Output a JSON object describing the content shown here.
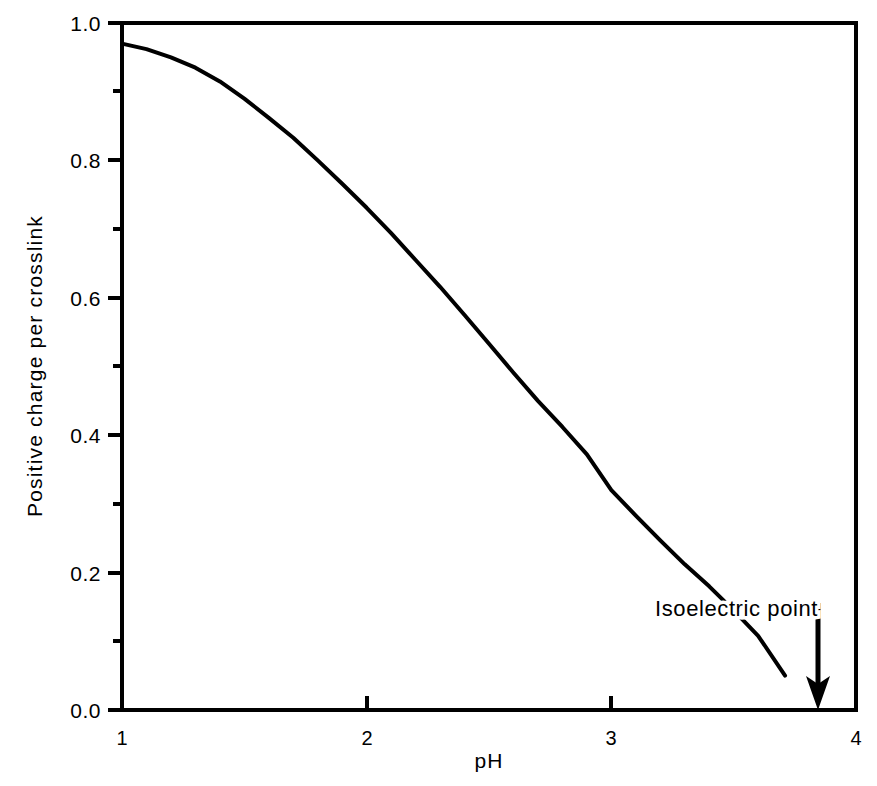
{
  "chart_data": {
    "type": "line",
    "title": "",
    "xlabel": "pH",
    "ylabel": "Positive charge per crosslink",
    "xlim": [
      1,
      4
    ],
    "ylim": [
      0.0,
      1.0
    ],
    "grid": false,
    "legend": null,
    "x_ticks": [
      "1",
      "2",
      "3",
      "4"
    ],
    "x_tick_values": [
      1,
      2,
      3,
      4
    ],
    "x_minor_ticks": [],
    "y_ticks": [
      "0.0",
      "0.2",
      "0.4",
      "0.6",
      "0.8",
      "1.0"
    ],
    "y_tick_values": [
      0.0,
      0.2,
      0.4,
      0.6,
      0.8,
      1.0
    ],
    "y_minor_tick_values": [
      0.1,
      0.3,
      0.5,
      0.7,
      0.9
    ],
    "series": [
      {
        "name": "Positive charge per crosslink",
        "color": "#000000",
        "line_width": 3,
        "x": [
          1.0,
          1.1,
          1.2,
          1.3,
          1.4,
          1.5,
          1.6,
          1.7,
          1.8,
          1.9,
          2.0,
          2.1,
          2.2,
          2.3,
          2.4,
          2.5,
          2.6,
          2.7,
          2.8,
          2.9,
          3.0,
          3.1,
          3.2,
          3.3,
          3.4,
          3.5,
          3.6,
          3.71
        ],
        "y": [
          0.97,
          0.962,
          0.95,
          0.935,
          0.915,
          0.89,
          0.862,
          0.833,
          0.8,
          0.766,
          0.731,
          0.694,
          0.655,
          0.616,
          0.575,
          0.533,
          0.491,
          0.45,
          0.412,
          0.372,
          0.32,
          0.283,
          0.247,
          0.212,
          0.18,
          0.145,
          0.108,
          0.05
        ]
      }
    ],
    "annotations": [
      {
        "name": "isoelectric-point-label",
        "text": "Isoelectric  point",
        "x": 3.16,
        "y": 0.175
      },
      {
        "name": "isoelectric-point-arrow",
        "type": "down-arrow",
        "x": 3.84,
        "y_from": 0.155,
        "y_to": 0.0
      }
    ]
  },
  "labels": {
    "y_axis_title": "Positive charge per crosslink",
    "x_axis_title": "pH",
    "annotation_isoelectric": "Isoelectric  point",
    "ytick_0": "0.0",
    "ytick_1": "0.2",
    "ytick_2": "0.4",
    "ytick_3": "0.6",
    "ytick_4": "0.8",
    "ytick_5": "1.0",
    "xtick_0": "1",
    "xtick_1": "2",
    "xtick_2": "3",
    "xtick_3": "4"
  },
  "colors": {
    "background": "#ffffff",
    "foreground": "#000000",
    "curve": "#000000"
  }
}
